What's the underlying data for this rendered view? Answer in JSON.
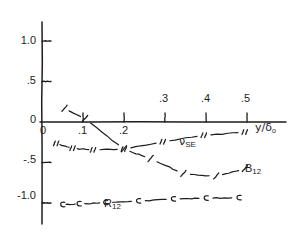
{
  "figure": {
    "background": "#ffffff",
    "ink": "#1d1d1d"
  },
  "axes": {
    "x_axis_label": "y/δ",
    "x_axis_label_sub": "o",
    "y_tick_labels": [
      "1.0",
      ".5",
      "0",
      "-.5",
      "-1.0"
    ],
    "y_tick_values": [
      1.0,
      0.5,
      0.0,
      -0.5,
      -1.0
    ],
    "x_tick_labels_below": [
      "0",
      ".1",
      ".2"
    ],
    "x_tick_labels_above": [
      ".3",
      ".4",
      ".5"
    ],
    "x_tick_values": [
      0.0,
      0.1,
      0.2,
      0.3,
      0.4,
      0.5
    ],
    "origin_label": "0"
  },
  "curve_labels": {
    "nu_se": "ν",
    "nu_se_sub": "SE",
    "b12": "B",
    "b12_sub": "12",
    "r12": "R",
    "r12_sub": "12"
  },
  "chart_data": {
    "type": "line",
    "title": "",
    "xlabel": "y/δo",
    "ylabel": "",
    "xlim": [
      -0.012,
      0.545
    ],
    "ylim": [
      -1.38,
      1.3
    ],
    "grid": false,
    "legend": "inline-annotations",
    "x_ticks": [
      0.0,
      0.1,
      0.2,
      0.3,
      0.4,
      0.5
    ],
    "y_ticks": [
      1.0,
      0.5,
      0.0,
      -0.5,
      -1.0
    ],
    "series": [
      {
        "name": "νSE",
        "label": "ν_SE",
        "x": [
          0.035,
          0.075,
          0.125,
          0.2,
          0.295,
          0.395,
          0.495
        ],
        "y": [
          -0.265,
          -0.325,
          -0.345,
          -0.335,
          -0.245,
          -0.165,
          -0.125
        ]
      },
      {
        "name": "B12",
        "label": "B_12",
        "x": [
          0.055,
          0.105,
          0.2,
          0.265,
          0.345,
          0.425,
          0.495
        ],
        "y": [
          0.165,
          0.04,
          -0.335,
          -0.455,
          -0.64,
          -0.67,
          -0.58
        ]
      },
      {
        "name": "R12",
        "label": "R_12",
        "x": [
          0.05,
          0.09,
          0.155,
          0.235,
          0.32,
          0.4,
          0.48
        ],
        "y": [
          -1.02,
          -1.01,
          -0.995,
          -0.975,
          -0.95,
          -0.94,
          -0.935
        ]
      }
    ]
  }
}
